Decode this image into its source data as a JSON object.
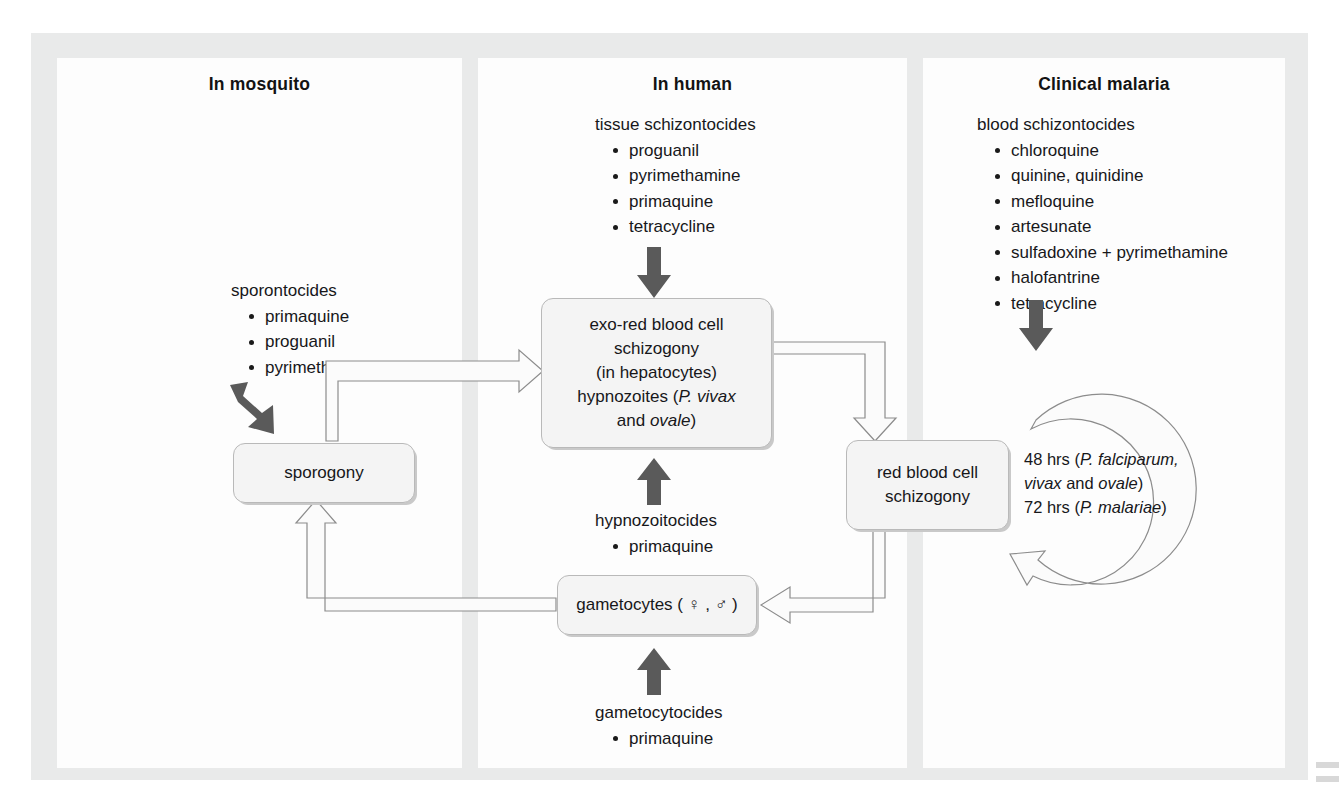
{
  "figure": {
    "type": "flow-diagram"
  },
  "panels": {
    "mosquito": {
      "title": "In mosquito",
      "drugs": {
        "head": "sporontocides",
        "items": [
          "primaquine",
          "proguanil",
          "pyrimethamine"
        ]
      }
    },
    "human": {
      "title": "In human",
      "drugs": {
        "head": "tissue schizontocides",
        "items": [
          "proguanil",
          "pyrimethamine",
          "primaquine",
          "tetracycline"
        ]
      },
      "hypnozoitocides": {
        "head": "hypnozoitocides",
        "items": [
          "primaquine"
        ]
      },
      "gametocytocides": {
        "head": "gametocytocides",
        "items": [
          "primaquine"
        ]
      }
    },
    "clinical": {
      "title": "Clinical malaria",
      "drugs": {
        "head": "blood schizontocides",
        "items": [
          "chloroquine",
          "quinine, quinidine",
          "mefloquine",
          "artesunate",
          "sulfadoxine + pyrimethamine",
          "halofantrine",
          "tetracycline"
        ]
      }
    }
  },
  "nodes": {
    "sporogony": "sporogony",
    "exo_rbc": {
      "line1": "exo-red blood cell",
      "line2": "schizogony",
      "line3": "(in hepatocytes)",
      "line4_pre": "hypnozoites (",
      "line4_italic": "P. vivax",
      "line5_pre": "and ",
      "line5_italic": "ovale",
      "line5_post": ")"
    },
    "rbc": {
      "line1": "red blood cell",
      "line2": "schizogony"
    },
    "gametocytes": {
      "text": "gametocytes ( ♀ , ♂ )"
    }
  },
  "cycle": {
    "line1_num": "48",
    "line1_pre": " hrs (",
    "line1_italic": "P. falciparum,",
    "line2_italic_a": "vivax",
    "line2_mid": " and ",
    "line2_italic_b": "ovale",
    "line2_post": ")",
    "line3_num": "72",
    "line3_pre": " hrs (",
    "line3_italic": "P. malariae",
    "line3_post": ")"
  },
  "colors": {
    "frame": "#e9eaea",
    "panel": "#fdfdfd",
    "node_fill": "#f4f4f4",
    "node_border": "#b9b9b9",
    "dark_arrow": "#5a5a5a",
    "hollow_stroke": "#8c8c8c",
    "text": "#17171a"
  }
}
